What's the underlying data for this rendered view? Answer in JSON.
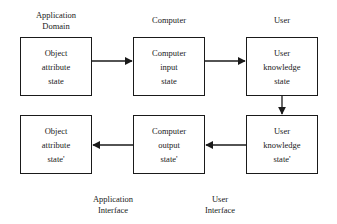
{
  "column_headers": {
    "application_domain": [
      "Application",
      "Domain"
    ],
    "computer": "Computer",
    "user": "User"
  },
  "boxes": {
    "object_state": [
      "Object",
      "attribute",
      "state"
    ],
    "computer_input": [
      "Computer",
      "input",
      "state"
    ],
    "user_knowledge": [
      "User",
      "knowledge",
      "state"
    ],
    "object_state_prime": [
      "Object",
      "attribute",
      "state'"
    ],
    "computer_output": [
      "Computer",
      "output",
      "state'"
    ],
    "user_knowledge_prime": [
      "User",
      "knowledge",
      "state'"
    ]
  },
  "bottom_labels": {
    "application_interface": [
      "Application",
      "Interface"
    ],
    "user_interface": [
      "User",
      "Interface"
    ]
  },
  "arrows": [
    {
      "from": "object_state",
      "to": "computer_input"
    },
    {
      "from": "computer_input",
      "to": "user_knowledge"
    },
    {
      "from": "user_knowledge",
      "to": "user_knowledge_prime"
    },
    {
      "from": "user_knowledge_prime",
      "to": "computer_output"
    },
    {
      "from": "computer_output",
      "to": "object_state_prime"
    }
  ]
}
